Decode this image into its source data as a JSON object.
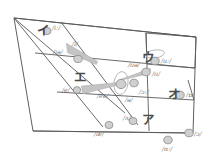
{
  "diagram": {
    "type": "vowel-chart",
    "colors": {
      "outline": "#4d4d4d",
      "grid": "#5a5a5a",
      "marker_fill": "#cfcfcf",
      "marker_stroke": "#8a8a8a",
      "arrow_fill": "#c4c4c4",
      "label_text": "#7c7c7c",
      "kana_text": "#4a4a4a",
      "background": "#ffffff"
    }
  },
  "kana_regions": [
    {
      "name": "i-region",
      "label": "イ",
      "x": 37,
      "y": 25
    },
    {
      "name": "u-region",
      "label": "ウ",
      "x": 142,
      "y": 52
    },
    {
      "name": "e-region",
      "label": "エ",
      "x": 74,
      "y": 72
    },
    {
      "name": "o-region",
      "label": "オ",
      "x": 168,
      "y": 89
    },
    {
      "name": "a-region",
      "label": "ア",
      "x": 142,
      "y": 114
    }
  ],
  "vowel_markers": [
    {
      "name": "marker-i-long",
      "ipa": "/iː/",
      "cx": 47,
      "cy": 31,
      "label_x": 52,
      "label_y": 25,
      "rx": 4.0,
      "ry": 3.6
    },
    {
      "name": "marker-ih",
      "ipa": "/ɪ/",
      "cx": 78,
      "cy": 59,
      "label_x": 72,
      "label_y": 41,
      "rx": 4.2,
      "ry": 3.6
    },
    {
      "name": "marker-e",
      "ipa": "/e/",
      "cx": 77,
      "cy": 90,
      "label_x": 62,
      "label_y": 87,
      "rx": 3.6,
      "ry": 3.4
    },
    {
      "name": "marker-ae",
      "ipa": "/æ/",
      "cx": 109,
      "cy": 125,
      "label_x": 94,
      "label_y": 131,
      "rx": 4.0,
      "ry": 3.6
    },
    {
      "name": "marker-uh",
      "ipa": "/ʌ/",
      "cx": 133,
      "cy": 121,
      "label_x": 123,
      "label_y": 115,
      "rx": 4.0,
      "ry": 3.6
    },
    {
      "name": "marker-a-long",
      "ipa": "/ɑː/",
      "cx": 168,
      "cy": 140,
      "label_x": 162,
      "label_y": 146,
      "rx": 4.2,
      "ry": 3.8
    },
    {
      "name": "marker-open-o",
      "ipa": "/ɔ/",
      "cx": 189,
      "cy": 133,
      "label_x": 194,
      "label_y": 131,
      "rx": 4.2,
      "ry": 3.8
    },
    {
      "name": "marker-o-short",
      "ipa": "/ɒ/",
      "cx": 180,
      "cy": 95,
      "label_x": 186,
      "label_y": 92,
      "rx": 4.2,
      "ry": 3.8
    },
    {
      "name": "marker-o-long",
      "ipa": "/ɔː/",
      "cx": 134,
      "cy": 83,
      "label_x": 139,
      "label_y": 89,
      "rx": 4.2,
      "ry": 3.8
    },
    {
      "name": "marker-u-short",
      "ipa": "/ʊ/",
      "cx": 146,
      "cy": 72,
      "label_x": 152,
      "label_y": 71,
      "rx": 4.2,
      "ry": 3.8
    },
    {
      "name": "marker-u-long",
      "ipa": "/uː/",
      "cx": 155,
      "cy": 61,
      "label_x": 161,
      "label_y": 58,
      "rx": 4.2,
      "ry": 3.8
    },
    {
      "name": "marker-schwa",
      "ipa": "/ə/",
      "cx": 121,
      "cy": 84,
      "label_x": 125,
      "label_y": 97,
      "rx": 5.0,
      "ry": 4.6
    }
  ],
  "extra_labels": [
    {
      "name": "label-ia-diphthong",
      "ipa": "/ɪə/",
      "x": 53,
      "y": 49
    },
    {
      "name": "label-ea-diphthong",
      "ipa": "/eə/",
      "x": 97,
      "y": 93
    },
    {
      "name": "label-ua-diphthong",
      "ipa": "/ʊə/",
      "x": 128,
      "y": 62
    }
  ],
  "ovals": [
    {
      "name": "oval-u-long-highlight",
      "cx": 155,
      "cy": 54,
      "rx": 9.5,
      "ry": 4.0,
      "rot": -8
    },
    {
      "name": "oval-schwa-highlight",
      "cx": 121,
      "cy": 83,
      "rx": 7.0,
      "ry": 11.5,
      "rot": 8
    }
  ],
  "diphthong_arrows": [
    {
      "name": "arrow-ia",
      "x1": 67,
      "y1": 48,
      "x2": 97,
      "y2": 63,
      "w1": 4.8,
      "w2": 1.6
    },
    {
      "name": "arrow-ea",
      "x1": 82,
      "y1": 90,
      "x2": 116,
      "y2": 84,
      "w1": 4.2,
      "w2": 1.4
    },
    {
      "name": "arrow-ua",
      "x1": 150,
      "y1": 70,
      "x2": 120,
      "y2": 80,
      "w1": 3.2,
      "w2": 1.2
    }
  ]
}
